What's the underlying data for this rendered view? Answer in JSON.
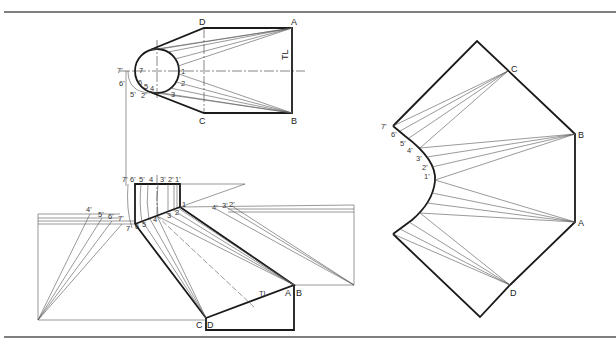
{
  "figure": {
    "views": {
      "top_view": {
        "corners": [
          "A",
          "B",
          "C",
          "D"
        ],
        "circle_points": [
          "1",
          "2",
          "3",
          "4",
          "5",
          "6",
          "7"
        ],
        "projected_points": [
          "7'",
          "6'",
          "5'",
          "4'"
        ],
        "true_length_label": "TL"
      },
      "front_view": {
        "top_labels": [
          "7'",
          "6'",
          "5'",
          "4",
          "3'",
          "2'",
          "1'"
        ],
        "edge_labels": [
          "7",
          "6",
          "5",
          "4",
          "3",
          "2",
          "1"
        ],
        "left_tl_labels": [
          "4'",
          "5'",
          "6'",
          "7'"
        ],
        "right_tl_labels": [
          "4'",
          "3'",
          "2'"
        ],
        "corners": [
          "A",
          "B",
          "C",
          "D"
        ],
        "true_length_label": "TL"
      },
      "development": {
        "corners": [
          "A",
          "B",
          "C",
          "D"
        ],
        "curve_points": [
          "7'",
          "6'",
          "5'",
          "4'",
          "3'",
          "2'",
          "1'"
        ]
      }
    }
  }
}
